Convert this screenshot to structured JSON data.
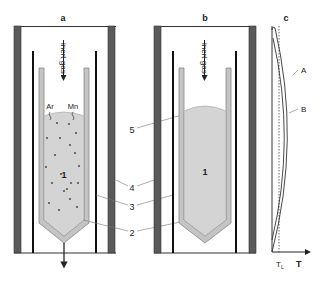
{
  "panels": {
    "a": {
      "title": "a",
      "gas_label": "inert gas",
      "species": [
        "Ar",
        "Mn"
      ],
      "melt_label": "1"
    },
    "b": {
      "title": "b",
      "gas_label": "inert gas",
      "melt_label": "1"
    },
    "c": {
      "title": "c",
      "curve_labels": [
        "A",
        "B"
      ],
      "x_axis_label": "T",
      "tick_label_main": "T",
      "tick_label_sub": "L"
    }
  },
  "callouts": [
    "4",
    "3",
    "2",
    "5"
  ],
  "colors": {
    "furnace_wall": "#5a5a5a",
    "rod": "#111111",
    "crucible": "#9a9a9a",
    "melt": "#d4d4d4",
    "line": "#444444"
  }
}
